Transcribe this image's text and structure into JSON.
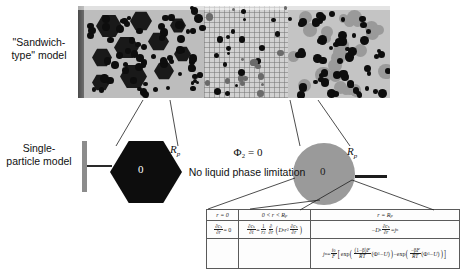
{
  "labels": {
    "sandwich_model": "\"Sandwich-type\" model",
    "single_particle_model": "Single-particle model"
  },
  "annotations": {
    "phi_condition": "Φ₂ = 0",
    "no_liquid_limitation": "No liquid phase limitation",
    "hex_center_origin": "0",
    "circle_center_origin": "0",
    "radius_symbol_hex": "Rₚ",
    "radius_symbol_circle": "Rₚ"
  },
  "equation_table": {
    "headers": [
      "r = 0",
      "0 < r < Rₚ",
      "r = Rₚ"
    ],
    "row_governing": [
      "∂cₛ/∂r = 0",
      "∂cₛ/∂t = (1/r²)∂/∂r ( Dₛ r² ∂cₛ/∂r )",
      "−Dₛ ∂cₛ/∂r = jₙ"
    ],
    "row_kinetics": [
      "",
      "",
      "jₙ = (i₀/F) [ exp( (1−β)F/RT (Φ₁−U) ) − exp( −βF/RT (Φ₁−U) ) ]"
    ]
  },
  "micrograph": {
    "alt": "electrode-separator-electrode cross-section micrograph",
    "zones": [
      "current-collector",
      "anode-active-layer",
      "separator-mesh",
      "cathode-active-layer"
    ]
  },
  "colors": {
    "particle_dark": "#0d0d0d",
    "particle_gray": "#9a9a9a",
    "matrix_gray": "#bdbdbd",
    "separator_gray": "#d2d2d2",
    "collector_gray": "#8c8c8c",
    "line": "#2a2a2a"
  }
}
